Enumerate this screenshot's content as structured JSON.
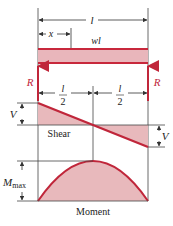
{
  "colors": {
    "beam_stroke": "#c8283c",
    "beam_fill": "#e9b6bb",
    "diagram_fill": "#e8b9bc",
    "curve_stroke": "#c0263a",
    "reaction": "#c0263a",
    "line": "#333333",
    "text": "#222222",
    "reaction_text": "#c0263a"
  },
  "dimensions": {
    "span_label": "l",
    "position_label": "x",
    "half_span_numerator": "l",
    "half_span_denominator": "2"
  },
  "load": {
    "label": "wl"
  },
  "reactions": {
    "left_label": "R",
    "right_label": "R"
  },
  "shear": {
    "title": "Shear",
    "left_magnitude_label": "V",
    "right_magnitude_label": "V"
  },
  "moment": {
    "title": "Moment",
    "max_label_main": "M",
    "max_label_sub": "max"
  }
}
